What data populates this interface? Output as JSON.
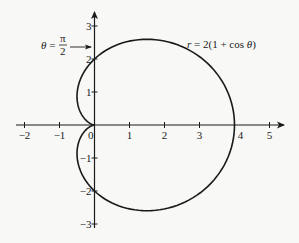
{
  "chart_data": {
    "type": "line",
    "title": "",
    "subtitle": "",
    "equation_label": "r = 2(1 + cos θ)",
    "annotation": {
      "text_lhs": "θ =",
      "numerator": "π",
      "denominator": "2",
      "points_to": [
        0,
        2.5
      ]
    },
    "xlabel": "",
    "ylabel": "",
    "xlim": [
      -2.2,
      5.4
    ],
    "ylim": [
      -3.2,
      3.4
    ],
    "grid": false,
    "legend": "none",
    "x_ticks": [
      -2,
      -1,
      0,
      1,
      2,
      3,
      4,
      5
    ],
    "x_tick_labels": [
      "−2",
      "−1",
      "0",
      "1",
      "2",
      "3",
      "4",
      "5"
    ],
    "y_ticks": [
      -3,
      -2,
      -1,
      1,
      2,
      3
    ],
    "y_tick_labels": [
      "−3",
      "−2",
      "−1",
      "1",
      "2",
      "3"
    ],
    "series": [
      {
        "name": "r = 2(1 + cos θ)",
        "kind": "polar-cardioid",
        "theta_deg": [
          0,
          15,
          30,
          45,
          60,
          75,
          90,
          105,
          120,
          135,
          150,
          165,
          180,
          195,
          210,
          225,
          240,
          255,
          270,
          285,
          300,
          315,
          330,
          345,
          360
        ],
        "x": [
          4.0,
          3.8,
          3.23,
          2.41,
          1.5,
          0.65,
          0.0,
          -0.38,
          -0.5,
          -0.41,
          -0.23,
          -0.06,
          0.0,
          -0.06,
          -0.23,
          -0.41,
          -0.5,
          -0.38,
          0.0,
          0.65,
          1.5,
          2.41,
          3.23,
          3.8,
          4.0
        ],
        "y": [
          0.0,
          1.02,
          1.87,
          2.41,
          2.6,
          2.42,
          2.0,
          1.42,
          0.87,
          0.41,
          0.13,
          0.02,
          0.0,
          -0.02,
          -0.13,
          -0.41,
          -0.87,
          -1.42,
          -2.0,
          -2.42,
          -2.6,
          -2.41,
          -1.87,
          -1.02,
          0.0
        ]
      }
    ]
  },
  "labels": {
    "equation": "r = 2(1 + cos θ)",
    "theta_lhs": "θ =",
    "pi": "π",
    "two": "2",
    "origin": "0"
  },
  "colors": {
    "ink": "#1a1a1a",
    "background": "#f8f8f7"
  }
}
